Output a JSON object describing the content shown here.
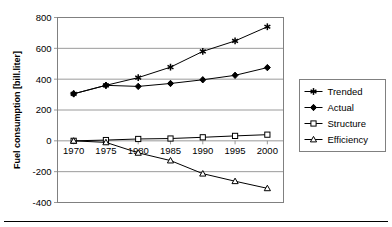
{
  "chart_data": {
    "type": "line",
    "title": "",
    "xlabel": "",
    "ylabel": "Fuel consumption [bill.liter]",
    "categories": [
      "1970",
      "1975",
      "1980",
      "1985",
      "1990",
      "1995",
      "2000"
    ],
    "x": [
      1970,
      1975,
      1980,
      1985,
      1990,
      1995,
      2000
    ],
    "xlim": [
      1967.5,
      2002.5
    ],
    "ylim": [
      -400,
      800
    ],
    "yticks": [
      -400,
      -200,
      0,
      200,
      400,
      600,
      800
    ],
    "ytick_labels": [
      "-400",
      "-200",
      "0",
      "200",
      "400",
      "600",
      "800"
    ],
    "grid": true,
    "legend_position": "right",
    "series": [
      {
        "name": "Trended",
        "marker": "star",
        "color": "#000000",
        "values": [
          305,
          360,
          410,
          478,
          580,
          648,
          740
        ]
      },
      {
        "name": "Actual",
        "marker": "diamond",
        "color": "#000000",
        "values": [
          305,
          360,
          353,
          372,
          396,
          425,
          475
        ]
      },
      {
        "name": "Structure",
        "marker": "square-open",
        "color": "#000000",
        "values": [
          0,
          5,
          12,
          15,
          23,
          32,
          40
        ]
      },
      {
        "name": "Efficiency",
        "marker": "triangle-open",
        "color": "#000000",
        "values": [
          0,
          -10,
          -78,
          -128,
          -213,
          -262,
          -308
        ]
      }
    ]
  },
  "legend": {
    "entries": [
      {
        "label": "Trended",
        "marker": "star"
      },
      {
        "label": "Actual",
        "marker": "diamond"
      },
      {
        "label": "Structure",
        "marker": "square-open"
      },
      {
        "label": "Efficiency",
        "marker": "triangle-open"
      }
    ]
  },
  "colors": {
    "ink": "#000000",
    "frame": "#808080",
    "grid": "#808080",
    "background": "#ffffff"
  }
}
